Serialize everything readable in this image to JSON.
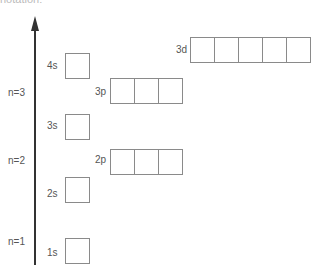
{
  "caption": "notation:",
  "axis": {
    "direction": "up",
    "label": "energy",
    "color": "#333333"
  },
  "shells": [
    {
      "label": "n=1"
    },
    {
      "label": "n=2"
    },
    {
      "label": "n=3"
    }
  ],
  "orbitals": {
    "s1": {
      "label": "1s",
      "boxes": 1
    },
    "s2": {
      "label": "2s",
      "boxes": 1
    },
    "p2": {
      "label": "2p",
      "boxes": 3
    },
    "s3": {
      "label": "3s",
      "boxes": 1
    },
    "p3": {
      "label": "3p",
      "boxes": 3
    },
    "s4": {
      "label": "4s",
      "boxes": 1
    },
    "d3": {
      "label": "3d",
      "boxes": 5
    }
  },
  "colors": {
    "box_border": "#8a8a8a",
    "text": "#555555",
    "arrow": "#333333"
  }
}
